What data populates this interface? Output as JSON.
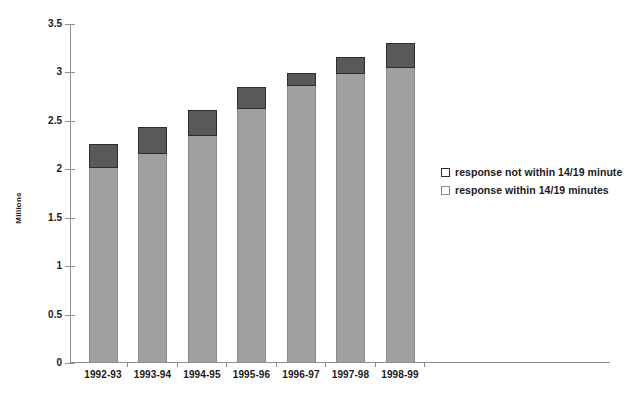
{
  "chart_data": {
    "type": "bar",
    "subtype": "stacked-bar",
    "title": "",
    "xlabel": "",
    "ylabel": "Millions",
    "ylim": [
      0,
      3.5
    ],
    "yticks": [
      "0",
      "0.5",
      "1",
      "1.5",
      "2",
      "2.5",
      "3",
      "3.5"
    ],
    "ytick_values": [
      0,
      0.5,
      1,
      1.5,
      2,
      2.5,
      3,
      3.5
    ],
    "grid": false,
    "legend_position": "right",
    "categories": [
      "1992-93",
      "1993-94",
      "1994-95",
      "1995-96",
      "1996-97",
      "1997-98",
      "1998-99"
    ],
    "series": [
      {
        "name": "response within 14/19 minutes",
        "color": "#a0a0a0",
        "values": [
          2.0,
          2.15,
          2.33,
          2.61,
          2.85,
          2.97,
          3.04
        ]
      },
      {
        "name": "response not within 14/19 minutes",
        "color": "#595959",
        "values": [
          0.25,
          0.28,
          0.27,
          0.23,
          0.13,
          0.18,
          0.25
        ]
      }
    ],
    "totals": [
      2.25,
      2.43,
      2.6,
      2.84,
      2.98,
      3.15,
      3.29
    ]
  },
  "legend": {
    "items": [
      {
        "label": "response not within 14/19 minute",
        "swatch": "dark-gray-swatch"
      },
      {
        "label": "response within 14/19 minutes",
        "swatch": "light-gray-swatch"
      }
    ]
  },
  "colors": {
    "not_within": "#595959",
    "within": "#a0a0a0",
    "axis": "#8e8e8e",
    "text": "#1a1a1a",
    "background": "#ffffff"
  }
}
